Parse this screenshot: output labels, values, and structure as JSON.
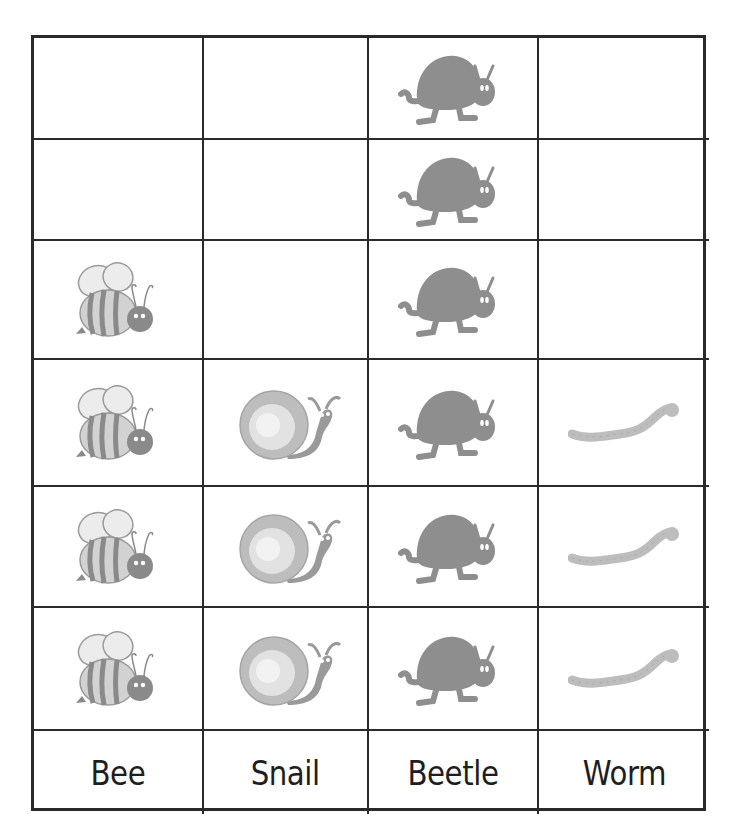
{
  "chart_data": {
    "type": "pictograph",
    "title": "",
    "categories": [
      "Bee",
      "Snail",
      "Beetle",
      "Worm"
    ],
    "values": [
      4,
      3,
      6,
      3
    ],
    "max_rows": 6,
    "icons": [
      "bee-icon",
      "snail-icon",
      "beetle-icon",
      "worm-icon"
    ],
    "grid": true,
    "legend": null
  },
  "table": {
    "columns": [
      {
        "label": "Bee",
        "icon": "bee-icon",
        "count": 4
      },
      {
        "label": "Snail",
        "icon": "snail-icon",
        "count": 3
      },
      {
        "label": "Beetle",
        "icon": "beetle-icon",
        "count": 6
      },
      {
        "label": "Worm",
        "icon": "worm-icon",
        "count": 3
      }
    ],
    "rows": 6
  },
  "colors": {
    "grid_line": "#2a2a2a",
    "beetle": "#8e8e8e",
    "bee_stripe": "#8a8a8a",
    "bee_body": "#cfcfcf",
    "snail_shell": "#c4c4c4",
    "worm": "#bdbdbd",
    "label_text": "#1e1e1e"
  }
}
